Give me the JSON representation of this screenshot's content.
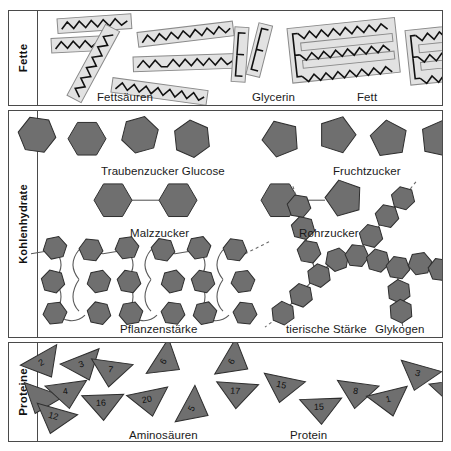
{
  "figure": {
    "background": "#ffffff",
    "frame_color": "#4a4a4a",
    "molecule_fill": "#6f6f6f",
    "molecule_stroke": "#2e2e2e",
    "lipid_fill": "#e2e2e2",
    "lipid_stroke": "#8a8a8a",
    "chain_color": "#111111"
  },
  "sections": [
    {
      "id": "fette",
      "category_label": "Fette",
      "captions": [
        {
          "text": "Fettsäuren",
          "x": 60,
          "y": 78
        },
        {
          "text": "Glycerin",
          "x": 215,
          "y": 78
        },
        {
          "text": "Fett",
          "x": 320,
          "y": 78
        }
      ]
    },
    {
      "id": "kohlenhydrate",
      "category_label": "Kohlenhydrate",
      "captions": [
        {
          "text": "Traubenzucker Glucose",
          "x": 64,
          "y": 52
        },
        {
          "text": "Fruchtzucker",
          "x": 296,
          "y": 52
        },
        {
          "text": "Malzzucker",
          "x": 93,
          "y": 114
        },
        {
          "text": "Rohrzucker",
          "x": 262,
          "y": 114
        },
        {
          "text": "Pflanzenstärke",
          "x": 83,
          "y": 210
        },
        {
          "text": "tierische Stärke",
          "x": 249,
          "y": 210
        },
        {
          "text": "Glykogen",
          "x": 338,
          "y": 210
        }
      ]
    },
    {
      "id": "proteine",
      "category_label": "Proteine",
      "captions": [
        {
          "text": "Aminosäuren",
          "x": 92,
          "y": 84
        },
        {
          "text": "Protein",
          "x": 253,
          "y": 84
        }
      ]
    }
  ],
  "molecules": {
    "fatty_acids": {
      "label": "Fettsäuren",
      "description": "einzelne Fettsäureketten als Zickzacklinien in hellgrauen Balken",
      "count": 7
    },
    "glycerin": {
      "label": "Glycerin",
      "description": "schmaler Balken mit drei Zinken (E-Form)",
      "count": 2
    },
    "fat": {
      "label": "Fett",
      "description": "Glycerin mit drei angelagerten Fettsäureketten",
      "count": 2
    },
    "glucose": {
      "label": "Traubenzucker Glucose",
      "shape": "hexagon",
      "count": 5
    },
    "fructose": {
      "label": "Fruchtzucker",
      "shape": "pentagon",
      "count": 4
    },
    "maltose": {
      "label": "Malzzucker",
      "shape": "hexagon + hexagon",
      "units": 2
    },
    "sucrose": {
      "label": "Rohrzucker",
      "shape": "hexagon + pentagon",
      "units": 2
    },
    "starch": {
      "label": "Pflanzenstärke",
      "shape": "helikale Kette aus Hexagonen"
    },
    "glycogen": {
      "label": "Glykogen",
      "alt_label": "tierische Stärke",
      "shape": "verzweigte Kette aus Hexagonen"
    },
    "amino_acids": {
      "label": "Aminosäuren",
      "shape": "triangle",
      "numbers": [
        2,
        3,
        6,
        4,
        7,
        12,
        16,
        20,
        5
      ]
    },
    "protein": {
      "label": "Protein",
      "shape": "verkettete Dreiecke",
      "sequence": [
        6,
        17,
        15,
        15,
        8,
        1,
        3,
        1
      ]
    }
  }
}
